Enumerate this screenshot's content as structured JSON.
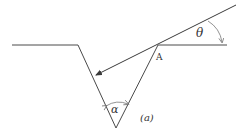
{
  "diagram": {
    "colors": {
      "stroke": "#4a4a4a",
      "arc": "#777777",
      "text": "#333333",
      "background": "#ffffff"
    },
    "labels": {
      "point": "A",
      "incidence_angle": "θ",
      "groove_angle": "α",
      "figure_tag": "(a)"
    },
    "geometry": {
      "surface_y": 45,
      "left_rim": [
        12,
        78
      ],
      "right_rim": [
        158,
        227
      ],
      "groove_bottom": [
        116,
        128
      ],
      "ray_start": [
        236,
        5
      ],
      "ray_end": [
        95,
        75
      ]
    }
  }
}
